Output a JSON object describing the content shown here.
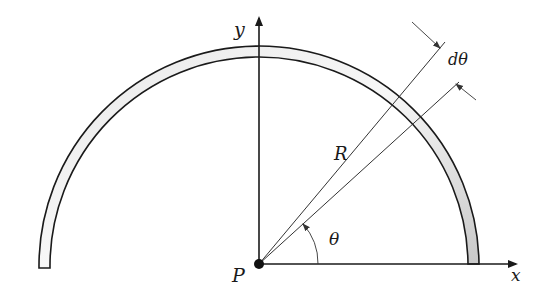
{
  "diagram": {
    "labels": {
      "y_axis": "y",
      "x_axis": "x",
      "origin": "P",
      "radius": "R",
      "angle": "θ",
      "differential_angle": "dθ"
    },
    "colors": {
      "stroke": "#1a1a1a",
      "ring_fill_light": "#f2f2f2",
      "ring_fill_dark": "#bdbdbd",
      "background": "#ffffff"
    },
    "geometry": {
      "origin_px": [
        259,
        264
      ],
      "ring_outer_radius_px": 220,
      "ring_inner_radius_px": 209,
      "theta_deg": 40,
      "dtheta_deg": 4
    }
  }
}
